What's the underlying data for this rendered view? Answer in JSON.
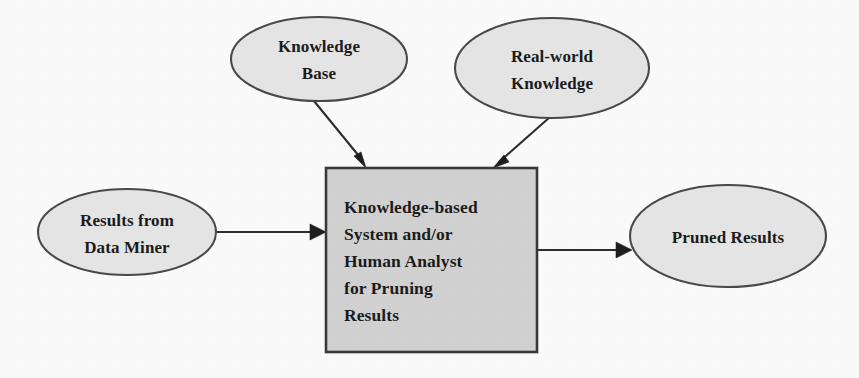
{
  "diagram": {
    "type": "flow-diagram",
    "canvas": {
      "width": 859,
      "height": 378
    },
    "colors": {
      "ellipse_fill": "#e9e9e9",
      "ellipse_stroke": "#4a4a4a",
      "box_fill": "#d5d5d5",
      "box_stroke": "#3a3a3a",
      "edge": "#2e2e2e",
      "text": "#1c1c1c",
      "background": "#ffffff"
    },
    "nodes": [
      {
        "id": "knowledge-base",
        "shape": "ellipse",
        "lines": [
          "Knowledge",
          "Base"
        ],
        "cx": 319,
        "cy": 59,
        "rx": 88,
        "ry": 42
      },
      {
        "id": "real-world-knowledge",
        "shape": "ellipse",
        "lines": [
          "Real-world",
          "Knowledge"
        ],
        "cx": 552,
        "cy": 68,
        "rx": 97,
        "ry": 50
      },
      {
        "id": "results-from-data-miner",
        "shape": "ellipse",
        "lines": [
          "Results from",
          "Data Miner"
        ],
        "cx": 127,
        "cy": 232,
        "rx": 89,
        "ry": 43
      },
      {
        "id": "knowledge-based-system",
        "shape": "rectangle",
        "lines": [
          "Knowledge-based",
          "System and/or",
          "Human Analyst",
          "for Pruning",
          "Results"
        ],
        "x": 326,
        "y": 168,
        "width": 211,
        "height": 184
      },
      {
        "id": "pruned-results",
        "shape": "ellipse",
        "lines": [
          "Pruned Results"
        ],
        "cx": 728,
        "cy": 236,
        "rx": 98,
        "ry": 51
      }
    ],
    "edges": [
      {
        "id": "kb-to-system",
        "from": "knowledge-base",
        "to": "knowledge-based-system",
        "x1": 314,
        "y1": 101,
        "x2": 366,
        "y2": 166
      },
      {
        "id": "rwk-to-system",
        "from": "real-world-knowledge",
        "to": "knowledge-based-system",
        "x1": 547,
        "y1": 118,
        "x2": 495,
        "y2": 166
      },
      {
        "id": "miner-to-system",
        "from": "results-from-data-miner",
        "to": "knowledge-based-system",
        "x1": 216,
        "y1": 232,
        "x2": 324,
        "y2": 232
      },
      {
        "id": "system-to-pruned",
        "from": "knowledge-based-system",
        "to": "pruned-results",
        "x1": 538,
        "y1": 250,
        "x2": 631,
        "y2": 250
      }
    ]
  }
}
